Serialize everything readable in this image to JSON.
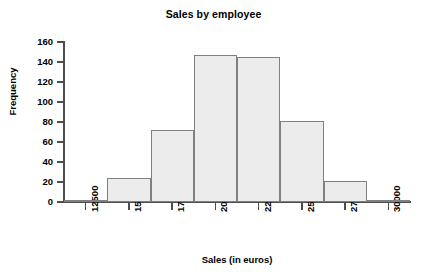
{
  "chart_data": {
    "type": "bar",
    "title": "Sales by employee",
    "xlabel": "Sales (in euros)",
    "ylabel": "Frequency",
    "grid": false,
    "legend": "none",
    "xtick_labels": [
      "12500",
      "15000",
      "17500",
      "20000",
      "22500",
      "25000",
      "27500",
      "30000"
    ],
    "xtick_values": [
      12500,
      15000,
      17500,
      20000,
      22500,
      25000,
      27500,
      30000
    ],
    "ytick_labels": [
      "0",
      "20",
      "40",
      "60",
      "80",
      "100",
      "120",
      "140",
      "160"
    ],
    "ytick_values": [
      0,
      20,
      40,
      60,
      80,
      100,
      120,
      140,
      160
    ],
    "ylim": [
      0,
      160
    ],
    "xlim": [
      11250,
      31250
    ],
    "bin_width": 2500,
    "bin_edges": [
      11250,
      13750,
      16250,
      18750,
      21250,
      23750,
      26250,
      28750,
      31250
    ],
    "categories": [
      "12500",
      "15000",
      "17500",
      "20000",
      "22500",
      "25000",
      "27500",
      "30000"
    ],
    "values": [
      1,
      24,
      72,
      147,
      145,
      81,
      21,
      2
    ],
    "bars": [
      {
        "center": 12500,
        "frequency": 1
      },
      {
        "center": 15000,
        "frequency": 24
      },
      {
        "center": 17500,
        "frequency": 72
      },
      {
        "center": 20000,
        "frequency": 147
      },
      {
        "center": 22500,
        "frequency": 145
      },
      {
        "center": 25000,
        "frequency": 81
      },
      {
        "center": 27500,
        "frequency": 21
      },
      {
        "center": 30000,
        "frequency": 2
      }
    ],
    "bar_fill_color": "#ececec",
    "bar_edge_color": "#808080",
    "axis_color": "#4d4d4d",
    "text_color": "#000000",
    "background_color": "#ffffff"
  }
}
